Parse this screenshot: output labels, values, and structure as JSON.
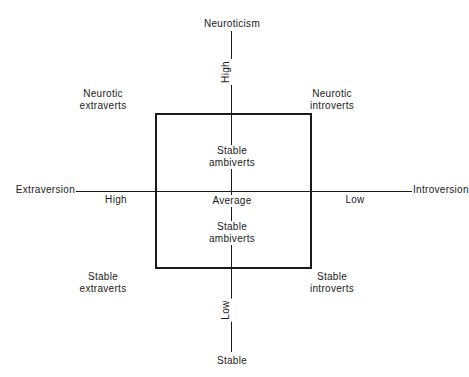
{
  "diagram": {
    "type": "quadrant",
    "axes": {
      "vertical": {
        "top_label": "Neuroticism",
        "bottom_label": "Stable",
        "high_label": "High",
        "low_label": "Low"
      },
      "horizontal": {
        "left_label": "Extraversion",
        "right_label": "Introversion",
        "high_label": "High",
        "low_label": "Low"
      },
      "center_label": "Average"
    },
    "quadrants": {
      "top_left": {
        "line1": "Neurotic",
        "line2": "extraverts"
      },
      "top_right": {
        "line1": "Neurotic",
        "line2": "introverts"
      },
      "bottom_left": {
        "line1": "Stable",
        "line2": "extraverts"
      },
      "bottom_right": {
        "line1": "Stable",
        "line2": "introverts"
      }
    },
    "inner": {
      "upper": {
        "line1": "Stable",
        "line2": "ambiverts"
      },
      "lower": {
        "line1": "Stable",
        "line2": "ambiverts"
      }
    },
    "colors": {
      "line": "#1a1a1a",
      "background": "#ffffff"
    }
  }
}
